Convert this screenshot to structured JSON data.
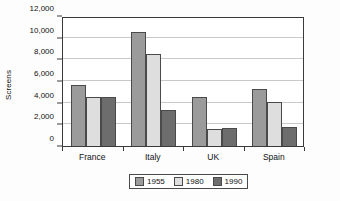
{
  "chart_data": {
    "type": "bar",
    "title": "",
    "xlabel": "",
    "ylabel": "Screens",
    "categories": [
      "France",
      "Italy",
      "UK",
      "Spain"
    ],
    "series": [
      {
        "name": "1955",
        "color": "#9b9b9b",
        "values": [
          5650,
          10550,
          4500,
          5250
        ]
      },
      {
        "name": "1980",
        "color": "#dedede",
        "values": [
          4500,
          8450,
          1550,
          4100
        ]
      },
      {
        "name": "1990",
        "color": "#6d6d6d",
        "values": [
          4500,
          3350,
          1650,
          1800
        ]
      }
    ],
    "ylim": [
      0,
      12000
    ],
    "ytick_step": 2000,
    "ytick_labels": [
      "0",
      "2,000",
      "4,000",
      "6,000",
      "8,000",
      "10,000",
      "12,000"
    ],
    "ytick_values": [
      0,
      2000,
      4000,
      6000,
      8000,
      10000,
      12000
    ],
    "grid": true,
    "legend_position": "bottom"
  }
}
